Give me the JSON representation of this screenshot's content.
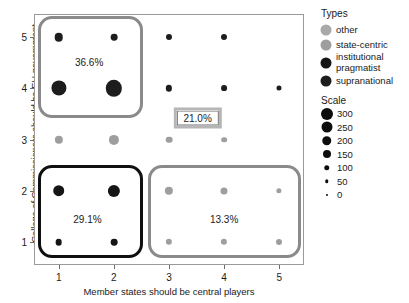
{
  "chart_data": {
    "type": "scatter",
    "title": "",
    "xlabel": "Member states should be central players",
    "ylabel": "Collage of Commissioners should be EU government",
    "xlim": [
      0.55,
      5.45
    ],
    "ylim": [
      0.55,
      5.45
    ],
    "xticks": [
      "1",
      "2",
      "3",
      "4",
      "5"
    ],
    "yticks": [
      "1",
      "2",
      "3",
      "4",
      "5"
    ],
    "grid": false,
    "legend_position": "right",
    "size_scale_name": "Scale",
    "type_legend_name": "Types",
    "points": [
      {
        "x": 1,
        "y": 5,
        "size": 60,
        "type": "supranational"
      },
      {
        "x": 2,
        "y": 5,
        "size": 30,
        "type": "supranational"
      },
      {
        "x": 3,
        "y": 5,
        "size": 22,
        "type": "supranational"
      },
      {
        "x": 4,
        "y": 5,
        "size": 22,
        "type": "supranational"
      },
      {
        "x": 1,
        "y": 4,
        "size": 250,
        "type": "supranational"
      },
      {
        "x": 2,
        "y": 4,
        "size": 300,
        "type": "supranational"
      },
      {
        "x": 3,
        "y": 4,
        "size": 25,
        "type": "supranational"
      },
      {
        "x": 4,
        "y": 4,
        "size": 20,
        "type": "supranational"
      },
      {
        "x": 5,
        "y": 4,
        "size": 12,
        "type": "supranational"
      },
      {
        "x": 1,
        "y": 3,
        "size": 55,
        "type": "state-centric"
      },
      {
        "x": 2,
        "y": 3,
        "size": 95,
        "type": "state-centric"
      },
      {
        "x": 3,
        "y": 3,
        "size": 30,
        "type": "state-centric"
      },
      {
        "x": 4,
        "y": 3,
        "size": 18,
        "type": "state-centric"
      },
      {
        "x": 1,
        "y": 2,
        "size": 130,
        "type": "institutional pragmatist"
      },
      {
        "x": 2,
        "y": 2,
        "size": 150,
        "type": "institutional pragmatist"
      },
      {
        "x": 3,
        "y": 2,
        "size": 55,
        "type": "state-centric"
      },
      {
        "x": 4,
        "y": 2,
        "size": 35,
        "type": "state-centric"
      },
      {
        "x": 5,
        "y": 2,
        "size": 14,
        "type": "state-centric"
      },
      {
        "x": 1,
        "y": 1,
        "size": 30,
        "type": "institutional pragmatist"
      },
      {
        "x": 2,
        "y": 1,
        "size": 30,
        "type": "institutional pragmatist"
      },
      {
        "x": 3,
        "y": 1,
        "size": 25,
        "type": "state-centric"
      },
      {
        "x": 4,
        "y": 1,
        "size": 25,
        "type": "state-centric"
      },
      {
        "x": 5,
        "y": 1,
        "size": 22,
        "type": "state-centric"
      }
    ],
    "clusters": [
      {
        "label": "36.6%",
        "x0": 0.63,
        "x1": 2.52,
        "y0": 3.42,
        "y1": 5.42,
        "label_x": 1.55,
        "label_y": 4.52,
        "border": "#8a8a8a"
      },
      {
        "label": "29.1%",
        "x0": 0.63,
        "x1": 2.52,
        "y0": 0.68,
        "y1": 2.5,
        "label_x": 1.52,
        "label_y": 1.45,
        "border": "#101010"
      },
      {
        "label": "13.3%",
        "x0": 2.62,
        "x1": 5.4,
        "y0": 0.68,
        "y1": 2.5,
        "label_x": 4.0,
        "label_y": 1.45,
        "border": "#8a8a8a"
      }
    ],
    "boxed_label": {
      "text": "21.0%",
      "x": 3.52,
      "y": 3.42
    }
  },
  "legend": {
    "types_title": "Types",
    "types": [
      {
        "label": "other",
        "color": "#a9a9a9",
        "diameter": 11
      },
      {
        "label": "state-centric",
        "color": "#9e9e9e",
        "diameter": 11
      },
      {
        "label": "institutional pragmatist",
        "color": "#151515",
        "diameter": 11
      },
      {
        "label": "supranational",
        "color": "#1d1d1d",
        "diameter": 11
      }
    ],
    "scale_title": "Scale",
    "scale": [
      {
        "label": "300",
        "diameter": 12
      },
      {
        "label": "250",
        "diameter": 11
      },
      {
        "label": "200",
        "diameter": 9.5
      },
      {
        "label": "150",
        "diameter": 8
      },
      {
        "label": "100",
        "diameter": 5.5
      },
      {
        "label": "50",
        "diameter": 3.5
      },
      {
        "label": "0",
        "diameter": 2
      }
    ]
  },
  "colors": {
    "other": "#a9a9a9",
    "state_centric": "#9e9e9e",
    "institutional_pragmatist": "#151515",
    "supranational": "#1d1d1d",
    "axis": "#9a9a9a",
    "text": "#1a1a1a"
  }
}
